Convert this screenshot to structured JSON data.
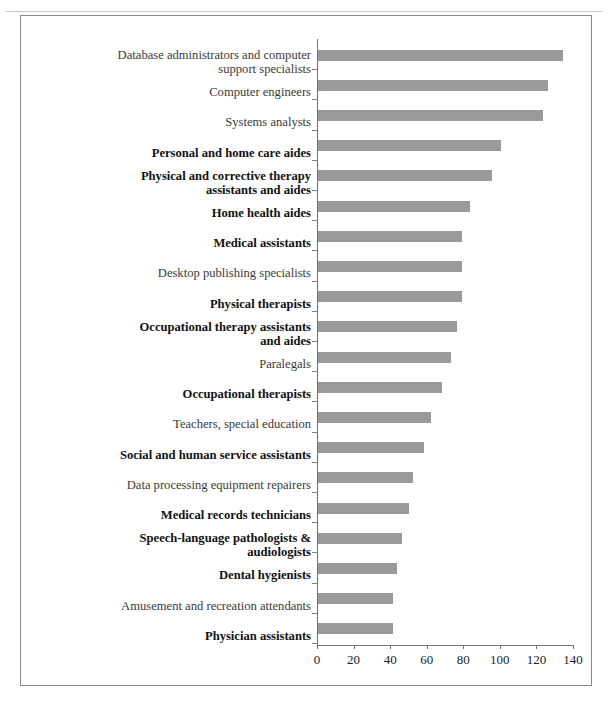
{
  "figure": {
    "background_color": "#ffffff",
    "frame_color": "#8a8a8a",
    "bar_color": "#9a9a9a",
    "axis_color": "#6f6f6f"
  },
  "chart_data": {
    "type": "bar",
    "orientation": "horizontal",
    "title": "",
    "subtitle": "",
    "xlabel": "",
    "ylabel": "",
    "xlim": [
      0,
      140
    ],
    "xticks": [
      0,
      20,
      40,
      60,
      80,
      100,
      120,
      140
    ],
    "grid": false,
    "legend": null,
    "categories": [
      "Database administrators and computer\nsupport specialists",
      "Computer engineers",
      "Systems analysts",
      "Personal and home care aides",
      "Physical and corrective therapy\nassistants and aides",
      "Home health aides",
      "Medical assistants",
      "Desktop publishing specialists",
      "Physical therapists",
      "Occupational therapy assistants\nand aides",
      "Paralegals",
      "Occupational therapists",
      "Teachers, special education",
      "Social and human service assistants",
      "Data processing equipment repairers",
      "Medical records technicians",
      "Speech-language pathologists &\naudiologists",
      "Dental hygienists",
      "Amusement and recreation attendants",
      "Physician assistants"
    ],
    "values": [
      134,
      126,
      123,
      100,
      95,
      83,
      79,
      79,
      79,
      76,
      73,
      68,
      62,
      58,
      52,
      50,
      46,
      43,
      41,
      41
    ],
    "emphasis": [
      false,
      false,
      false,
      true,
      true,
      true,
      true,
      false,
      true,
      true,
      false,
      true,
      false,
      true,
      false,
      true,
      true,
      true,
      false,
      true
    ]
  }
}
